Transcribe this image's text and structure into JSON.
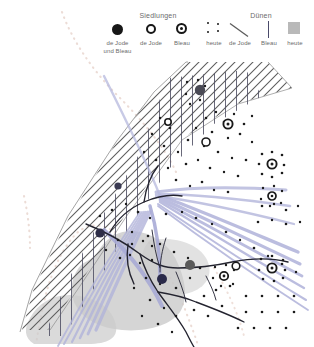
{
  "map": {
    "title": "Siedlungs- und Dünenvergleich",
    "legend": {
      "settlements": {
        "title": "Siedlungen",
        "items": [
          {
            "label": "de Jode\nund Bleau",
            "label_line1": "de Jode",
            "label_line2": "und Bleau",
            "symbol": "filled-circle-icon"
          },
          {
            "label": "de Jode",
            "label_line1": "de Jode",
            "label_line2": "",
            "symbol": "open-circle-icon"
          },
          {
            "label": "Bleau",
            "label_line1": "Bleau",
            "label_line2": "",
            "symbol": "donut-circle-icon"
          },
          {
            "label": "heute",
            "label_line1": "heute",
            "label_line2": "",
            "symbol": "dot-cluster-icon"
          }
        ]
      },
      "dunes": {
        "title": "Dünen",
        "items": [
          {
            "label": "de Jode",
            "symbol": "diagonal-hatch-icon"
          },
          {
            "label": "Bleau",
            "symbol": "vertical-line-icon"
          },
          {
            "label": "heute",
            "symbol": "gray-square-icon"
          }
        ]
      }
    },
    "colors": {
      "settlement_dark": "#171717",
      "dune_hatch": "#5a5a5a",
      "dune_vertical": "#4a4a6a",
      "dune_modern_fill": "#c3c3c3",
      "water_band": "#aeb0d8",
      "coast_line": "#2b2b3a",
      "historic_coast_dots": "#e8d8d2"
    },
    "features": {
      "settlements_de_jode_und_bleau": 4,
      "settlements_de_jode": 3,
      "settlements_bleau": 5,
      "settlements_heute_clusters": 6
    }
  }
}
